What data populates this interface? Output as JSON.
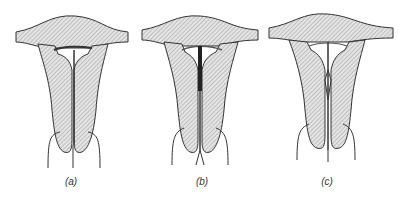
{
  "figure": {
    "panels": [
      {
        "id": "a",
        "label": "(a)",
        "device": "T-shaped IUD with curved arms and stem"
      },
      {
        "id": "b",
        "label": "(b)",
        "device": "IUD with dark vertical stem and threads"
      },
      {
        "id": "c",
        "label": "(c)",
        "device": "IUD with arrow-shaped stem"
      }
    ],
    "colors": {
      "line": "#333333",
      "hatch": "#8a8a8a",
      "fill": "#e6e6e6"
    }
  }
}
